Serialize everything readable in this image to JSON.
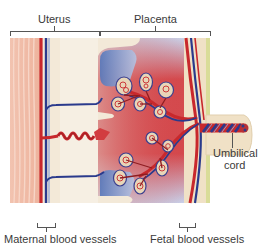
{
  "diagram": {
    "labels": {
      "uterus": "Uterus",
      "placenta": "Placenta",
      "umbilical_cord_line1": "Umbilical",
      "umbilical_cord_line2": "cord",
      "maternal_blood_vessels": "Maternal blood vessels",
      "fetal_blood_vessels": "Fetal blood vessels"
    },
    "colors": {
      "artery_red": "#c8282c",
      "vein_blue": "#2a3a8c",
      "muscle_pink": "#f0b9a4",
      "tissue_cream": "#f3e9d8",
      "maternal_blood_red": "#d9464a",
      "maternal_blood_blue": "#6f8cc8",
      "label_text": "#3a3a3a"
    }
  }
}
